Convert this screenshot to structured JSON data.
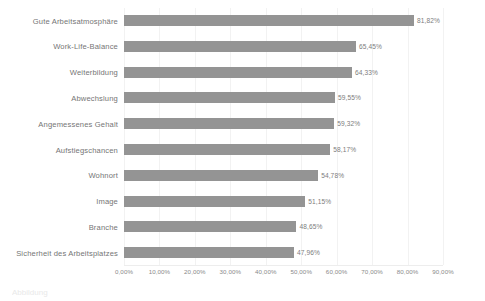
{
  "chart_data": {
    "type": "bar",
    "orientation": "horizontal",
    "title": "",
    "xlabel": "",
    "ylabel": "",
    "xlim": [
      0,
      90
    ],
    "grid": true,
    "legend": false,
    "bar_color": "#949494",
    "categories": [
      "Gute Arbeitsatmosphäre",
      "Work-Life-Balance",
      "Weiterbildung",
      "Abwechslung",
      "Angemessenes Gehalt",
      "Aufstiegschancen",
      "Wohnort",
      "Image",
      "Branche",
      "Sicherheit des Arbeitsplatzes"
    ],
    "values": [
      81.82,
      65.45,
      64.33,
      59.55,
      59.32,
      58.17,
      54.78,
      51.15,
      48.65,
      47.96
    ],
    "value_labels": [
      "81,82%",
      "65,45%",
      "64,33%",
      "59,55%",
      "59,32%",
      "58,17%",
      "54,78%",
      "51,15%",
      "48,65%",
      "47,96%"
    ],
    "xticks": [
      0,
      10,
      20,
      30,
      40,
      50,
      60,
      70,
      80,
      90
    ],
    "xtick_labels": [
      "0,00%",
      "10,00%",
      "20,00%",
      "30,00%",
      "40,00%",
      "50,00%",
      "60,00%",
      "70,00%",
      "80,00%",
      "90,00%"
    ]
  },
  "caption": {
    "clipped_text": "Abbildung"
  }
}
